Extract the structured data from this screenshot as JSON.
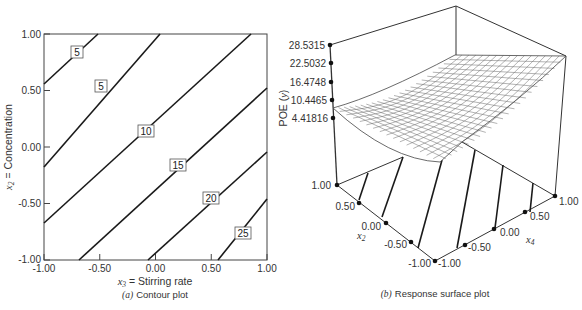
{
  "chart_data": [
    {
      "type": "contour",
      "panel": "a",
      "caption_letter": "(a)",
      "caption_text": "Contour plot",
      "xlabel_var": "x",
      "xlabel_sub": "3",
      "xlabel_text": " = Stirring rate",
      "ylabel_var": "x",
      "ylabel_sub": "2",
      "ylabel_text": " = Concentration",
      "xlim": [
        -1.0,
        1.0
      ],
      "ylim": [
        -1.0,
        1.0
      ],
      "x_ticks": [
        "-1.00",
        "-0.50",
        "0.00",
        "0.50",
        "1.00"
      ],
      "y_ticks": [
        "-1.00",
        "-0.50",
        "0.00",
        "0.50",
        "1.00"
      ],
      "grid": false,
      "contour_labels": [
        "5",
        "5",
        "10",
        "15",
        "20",
        "25"
      ],
      "contours": [
        {
          "label": "5",
          "points": [
            [
              -1.0,
              0.56
            ],
            [
              -0.52,
              1.0
            ]
          ]
        },
        {
          "label": "5",
          "points": [
            [
              -1.0,
              0.04
            ],
            [
              0.04,
              1.0
            ]
          ]
        },
        {
          "label": "10",
          "points": [
            [
              -1.0,
              -0.67
            ],
            [
              0.85,
              1.0
            ]
          ]
        },
        {
          "label": "15",
          "points": [
            [
              -0.69,
              -1.0
            ],
            [
              1.0,
              0.52
            ]
          ]
        },
        {
          "label": "20",
          "points": [
            [
              -0.07,
              -1.0
            ],
            [
              1.0,
              -0.05
            ]
          ]
        },
        {
          "label": "25",
          "points": [
            [
              0.56,
              -1.0
            ],
            [
              1.0,
              -0.61
            ]
          ]
        }
      ]
    },
    {
      "type": "surface",
      "panel": "b",
      "caption_letter": "(b)",
      "caption_text": "Response surface plot",
      "zlabel": "POE (y)",
      "zlabel_main": "POE (",
      "zlabel_var": "y",
      "zlabel_end": ")",
      "z_ticks": [
        "28.5315",
        "22.5032",
        "16.4748",
        "10.4465",
        "4.41816"
      ],
      "x2_label_var": "x",
      "x2_label_sub": "2",
      "x4_label_var": "x",
      "x4_label_sub": "4",
      "x2_ticks": [
        "1.00",
        "0.50",
        "0.00",
        "-0.50",
        "-1.00"
      ],
      "x4_ticks": [
        "-1.00",
        "-0.50",
        "0.00",
        "0.50",
        "1.00"
      ],
      "zlim": [
        4.41816,
        28.5315
      ],
      "x2lim": [
        -1.0,
        1.0
      ],
      "x4lim": [
        -1.0,
        1.0
      ],
      "floor_contours": 6,
      "mesh": "wireframe"
    }
  ]
}
